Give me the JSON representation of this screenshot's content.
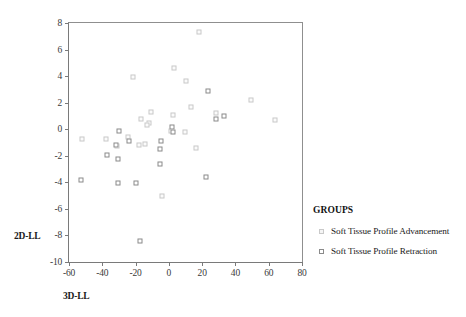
{
  "chart_data": {
    "type": "scatter",
    "title": "",
    "xlabel": "3D-LL",
    "ylabel": "2D-LL",
    "xlim": [
      -60,
      80
    ],
    "ylim": [
      -10,
      8
    ],
    "xticks": [
      "-60",
      "-40",
      "-20",
      "0",
      "20",
      "40",
      "60",
      "80"
    ],
    "xtick_values": [
      -60,
      -40,
      -20,
      0,
      20,
      40,
      60,
      80
    ],
    "yticks": [
      "8",
      "6",
      "4",
      "2",
      "0",
      "-2",
      "-4",
      "-6",
      "-8",
      "-10"
    ],
    "ytick_values": [
      8,
      6,
      4,
      2,
      0,
      -2,
      -4,
      -6,
      -8,
      -10
    ],
    "grid": false,
    "legend_position": "right",
    "legend_title": "GROUPS",
    "series": [
      {
        "name": "Soft Tissue Profile Advancement",
        "marker": "open-square-light",
        "color": "#c9c9c9",
        "points": [
          [
            -21.5,
            3.9
          ],
          [
            3.0,
            4.6
          ],
          [
            10.5,
            3.6
          ],
          [
            13.5,
            1.7
          ],
          [
            49.5,
            2.2
          ],
          [
            18.0,
            7.3
          ],
          [
            64.0,
            0.7
          ],
          [
            28.5,
            1.2
          ],
          [
            -16.5,
            0.8
          ],
          [
            -10.5,
            1.3
          ],
          [
            2.5,
            1.1
          ],
          [
            -12.0,
            0.5
          ],
          [
            -13.0,
            0.3
          ],
          [
            -14.5,
            -1.1
          ],
          [
            -18.0,
            -1.2
          ],
          [
            1.5,
            -0.1
          ],
          [
            9.5,
            -0.2
          ],
          [
            16.5,
            -1.4
          ],
          [
            -52.0,
            -0.7
          ],
          [
            -38.0,
            -0.7
          ],
          [
            -31.0,
            -1.3
          ],
          [
            -24.5,
            -0.6
          ],
          [
            -4.0,
            -5.0
          ]
        ]
      },
      {
        "name": "Soft Tissue Profile Retraction",
        "marker": "open-square-dark",
        "color": "#8a8a8a",
        "points": [
          [
            23.5,
            2.9
          ],
          [
            33.0,
            1.0
          ],
          [
            28.5,
            0.8
          ],
          [
            -30.0,
            -0.1
          ],
          [
            -24.0,
            -0.9
          ],
          [
            -4.5,
            -0.9
          ],
          [
            -5.5,
            -1.5
          ],
          [
            2.0,
            0.2
          ],
          [
            2.5,
            -0.2
          ],
          [
            -31.5,
            -1.2
          ],
          [
            -37.0,
            -1.95
          ],
          [
            -30.5,
            -2.25
          ],
          [
            -5.5,
            -2.65
          ],
          [
            -30.5,
            -4.05
          ],
          [
            -20.0,
            -4.05
          ],
          [
            -53.0,
            -3.8
          ],
          [
            22.5,
            -3.6
          ],
          [
            -17.5,
            -8.45
          ]
        ]
      }
    ]
  }
}
